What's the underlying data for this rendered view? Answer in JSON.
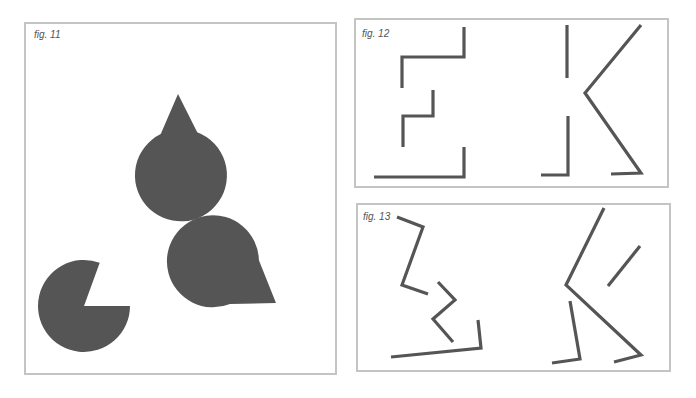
{
  "figures": [
    {
      "id": "fig11",
      "caption": "fig. 11",
      "description": "Kanizsa illusory triangle formed by three pac-man shapes",
      "shapes": [
        {
          "type": "pacman",
          "cx": 177,
          "cy": 91,
          "r": 46,
          "mouth": [
            [
              160,
              136
            ],
            [
              178,
              94
            ],
            [
              199,
              136
            ]
          ]
        },
        {
          "type": "pacman",
          "cx": 84,
          "cy": 306,
          "r": 46,
          "mouth": [
            [
              100,
              262
            ],
            [
              84,
              306
            ],
            [
              130,
              306
            ]
          ]
        },
        {
          "type": "pacman",
          "cx": 276,
          "cy": 303,
          "r": 46,
          "mouth": [
            [
              258,
              258
            ],
            [
              276,
              303
            ],
            [
              229,
              304
            ]
          ]
        }
      ]
    },
    {
      "id": "fig12",
      "caption": "fig. 12",
      "description": "Fragmented letters E and K",
      "polylines": [
        [
          [
            464,
            27
          ],
          [
            464,
            57
          ],
          [
            402,
            57
          ],
          [
            402,
            88
          ]
        ],
        [
          [
            433,
            90
          ],
          [
            433,
            116
          ],
          [
            403,
            116
          ],
          [
            403,
            147
          ]
        ],
        [
          [
            464,
            147
          ],
          [
            464,
            177
          ],
          [
            374,
            177
          ]
        ],
        [
          [
            567,
            25
          ],
          [
            567,
            78
          ]
        ],
        [
          [
            641,
            25
          ],
          [
            585,
            93
          ],
          [
            641,
            173
          ],
          [
            611,
            174
          ]
        ],
        [
          [
            568,
            116
          ],
          [
            568,
            175
          ],
          [
            541,
            175
          ]
        ]
      ]
    },
    {
      "id": "fig13",
      "caption": "fig. 13",
      "description": "Rotated/displaced fragments of E and K",
      "polylines": [
        [
          [
            397,
            217
          ],
          [
            423,
            227
          ],
          [
            402,
            285
          ],
          [
            428,
            294
          ]
        ],
        [
          [
            438,
            282
          ],
          [
            455,
            300
          ],
          [
            433,
            319
          ],
          [
            453,
            342
          ]
        ],
        [
          [
            478,
            320
          ],
          [
            481,
            348
          ],
          [
            391,
            357
          ]
        ],
        [
          [
            604,
            208
          ],
          [
            566,
            285
          ],
          [
            641,
            355
          ],
          [
            614,
            362
          ]
        ],
        [
          [
            608,
            286
          ],
          [
            640,
            246
          ]
        ],
        [
          [
            570,
            301
          ],
          [
            580,
            359
          ],
          [
            552,
            363
          ]
        ]
      ]
    }
  ],
  "colors": {
    "shape": "#555555",
    "frame": "#c4c4c4",
    "background": "#ffffff"
  }
}
